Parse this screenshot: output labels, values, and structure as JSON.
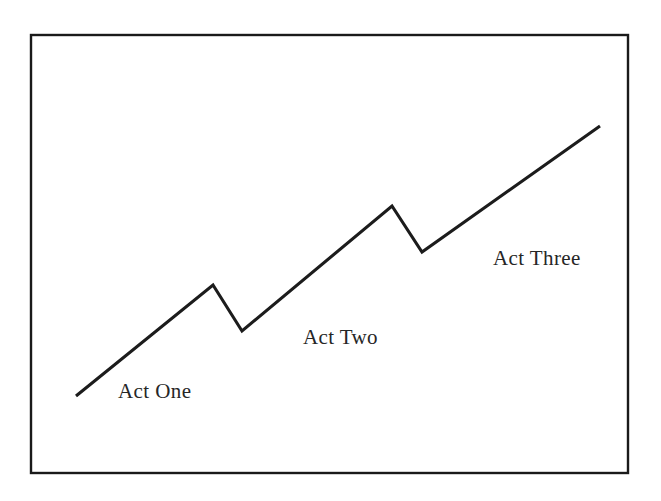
{
  "figure": {
    "background_color": "#ffffff",
    "border_color": "#1a1a1a",
    "line_color": "#1c1c1c"
  },
  "labels": {
    "act_one": "Act One",
    "act_two": "Act Two",
    "act_three": "Act Three"
  },
  "chart_data": {
    "type": "line",
    "subtitle": "",
    "xlabel": "",
    "ylabel": "",
    "grid": false,
    "legend_position": "none",
    "axis_visible": false,
    "xlim": [
      31,
      628
    ],
    "ylim": [
      35,
      473
    ],
    "note": "y values are screen coordinates; lower y = higher tension/rising action",
    "series": [
      {
        "name": "Rising action",
        "points": [
          {
            "x": 76,
            "y": 396,
            "role": "start"
          },
          {
            "x": 213,
            "y": 285,
            "role": "peak-1"
          },
          {
            "x": 242,
            "y": 331,
            "role": "valley-1"
          },
          {
            "x": 392,
            "y": 206,
            "role": "peak-2"
          },
          {
            "x": 422,
            "y": 252,
            "role": "valley-2"
          },
          {
            "x": 600,
            "y": 126,
            "role": "climax"
          }
        ]
      }
    ],
    "annotations": [
      {
        "text": "Act One",
        "x": 118,
        "y": 398
      },
      {
        "text": "Act Two",
        "x": 303,
        "y": 344
      },
      {
        "text": "Act Three",
        "x": 493,
        "y": 265
      }
    ]
  }
}
